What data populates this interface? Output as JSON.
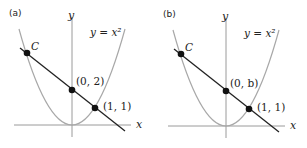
{
  "figure": {
    "panels": [
      {
        "id": "a",
        "label": "(a)",
        "axis_x_label": "x",
        "axis_y_label": "y",
        "curve_label": "y = x²",
        "points": [
          {
            "name": "C",
            "label": "C"
          },
          {
            "name": "y-intercept",
            "label": "(0, 2)"
          },
          {
            "name": "p11",
            "label": "(1, 1)"
          }
        ]
      },
      {
        "id": "b",
        "label": "(b)",
        "axis_x_label": "x",
        "axis_y_label": "y",
        "curve_label": "y = x²",
        "points": [
          {
            "name": "C",
            "label": "C"
          },
          {
            "name": "y-intercept",
            "label": "(0, b)"
          },
          {
            "name": "p11",
            "label": "(1, 1)"
          }
        ]
      }
    ],
    "colors": {
      "axis": "#9a9a9a",
      "parabola": "#a8a8a8",
      "line": "#222222",
      "point": "#111111",
      "text": "#222222"
    }
  }
}
